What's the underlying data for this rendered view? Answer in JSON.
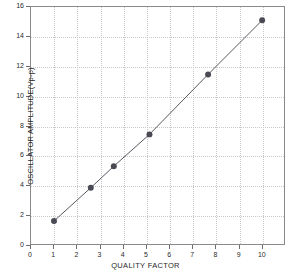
{
  "chart_data": {
    "type": "scatter",
    "title": "",
    "xlabel": "QUALITY FACTOR",
    "ylabel": "OSCILLATOR AMPLITUDE(Vp-p)",
    "xlim": [
      0,
      11
    ],
    "ylim": [
      0,
      16
    ],
    "xticks": [
      0,
      1,
      2,
      3,
      4,
      5,
      6,
      7,
      8,
      9,
      10
    ],
    "yticks": [
      0,
      2,
      4,
      6,
      8,
      10,
      12,
      14,
      16
    ],
    "xtick_labels": [
      "0",
      "1",
      "2",
      "3",
      "4",
      "5",
      "6",
      "7",
      "8",
      "9",
      "10"
    ],
    "ytick_labels": [
      "0",
      "2",
      "4",
      "6",
      "8",
      "10",
      "12",
      "14",
      "16"
    ],
    "grid": true,
    "grid_style": "dotted",
    "legend": null,
    "series": [
      {
        "name": "Oscillator amplitude vs quality factor",
        "marker": "filled-circle",
        "marker_color": "#4a4a55",
        "line_color": "#55555f",
        "line_style": "solid",
        "x": [
          1.0,
          2.6,
          3.6,
          5.15,
          7.7,
          10.05
        ],
        "y": [
          1.55,
          3.8,
          5.25,
          7.4,
          11.45,
          15.1
        ],
        "points": [
          {
            "x": 1.0,
            "y": 1.55
          },
          {
            "x": 2.6,
            "y": 3.8
          },
          {
            "x": 3.6,
            "y": 5.25
          },
          {
            "x": 5.15,
            "y": 7.4
          },
          {
            "x": 7.7,
            "y": 11.45
          },
          {
            "x": 10.05,
            "y": 15.1
          }
        ]
      }
    ],
    "colors": {
      "axis": "#8a8a8a",
      "grid": "#c9c9c9",
      "text": "#1f1f1f",
      "marker": "#4a4a55",
      "line": "#55555f",
      "background": "#ffffff"
    }
  }
}
